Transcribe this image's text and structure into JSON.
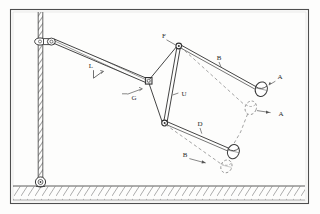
{
  "figure": {
    "colors": {
      "line": "#3a3a3a",
      "line_light": "#6e6e6e",
      "dashed": "#8a8a8a",
      "border": "#555555",
      "ground_hatch": "#7a7a7a",
      "background": "#fdfdfc"
    }
  },
  "labels": {
    "boom_angle": "L",
    "boom_tip_joint": "G",
    "upper_pivot": "F",
    "link_member": "U",
    "upper_arm_solid": "B",
    "bucket_upper_solid": "A",
    "bucket_upper_dashed": "A",
    "lower_arm_solid": "D",
    "lower_arm_dashed": "B"
  },
  "components": {
    "mast": "vertical hatched mast column",
    "mast_top_joint": "pin joint at mast head",
    "mast_base_joint": "pin joint at mast base on ground",
    "boom": "diagonal hatched boom from mast head to boom tip",
    "ground": "hatched ground band",
    "frame_border": "rectangular figure border",
    "bucket_solid_upper": "bucket ellipse at upper position",
    "bucket_dashed_mid": "bucket ellipse at intermediate dashed position",
    "bucket_solid_lower": "bucket ellipse at lower position",
    "bucket_dashed_lower": "bucket ellipse at lower dashed position"
  }
}
